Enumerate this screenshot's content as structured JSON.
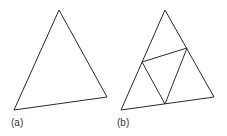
{
  "figure": {
    "stroke_color": "#2a2a2a",
    "panels": [
      {
        "label": "(a)",
        "triangle": [
          [
            59,
            10
          ],
          [
            14,
            110
          ],
          [
            107,
            97
          ]
        ],
        "inner_lines": []
      },
      {
        "label": "(b)",
        "triangle": [
          [
            165,
            10
          ],
          [
            121,
            110
          ],
          [
            214,
            97
          ]
        ],
        "inner_lines": [
          [
            [
              142,
              62
            ],
            [
              187,
              48
            ]
          ],
          [
            [
              142,
              62
            ],
            [
              165,
              104
            ]
          ],
          [
            [
              187,
              48
            ],
            [
              165,
              104
            ]
          ]
        ]
      }
    ]
  }
}
